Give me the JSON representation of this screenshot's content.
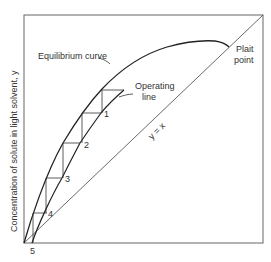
{
  "diagram": {
    "type": "extraction-stage-diagram",
    "ylabel": "Concentration of solute in light solvent, y",
    "labels": {
      "equilibrium_curve": "Equilibrium curve",
      "operating_line_1": "Operating",
      "operating_line_2": "line",
      "plait_1": "Plait",
      "plait_2": "point",
      "diagonal": "y = x"
    },
    "stages": [
      "1",
      "2",
      "3",
      "4",
      "5"
    ],
    "colors": {
      "line": "#222222",
      "frame": "#555555",
      "text": "#333333"
    }
  }
}
